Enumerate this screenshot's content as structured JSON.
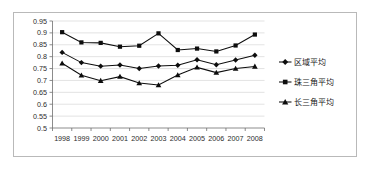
{
  "chart_data": {
    "type": "line",
    "title": "",
    "xlabel": "",
    "ylabel": "",
    "grid": true,
    "legend_position": "right",
    "ylim": [
      0.5,
      0.95
    ],
    "ytick_labels": [
      "0.95",
      "0.9",
      "0.85",
      "0.8",
      "0.75",
      "0.7",
      "0.65",
      "0.6",
      "0.55",
      "0.5"
    ],
    "ytick_values": [
      0.95,
      0.9,
      0.85,
      0.8,
      0.75,
      0.7,
      0.65,
      0.6,
      0.55,
      0.5
    ],
    "categories": [
      "1998",
      "1999",
      "2000",
      "2001",
      "2002",
      "2003",
      "2004",
      "2005",
      "2006",
      "2007",
      "2008"
    ],
    "series": [
      {
        "name": "区域平均",
        "marker": "diamond",
        "values": [
          0.818,
          0.775,
          0.76,
          0.765,
          0.75,
          0.761,
          0.764,
          0.787,
          0.766,
          0.786,
          0.806
        ]
      },
      {
        "name": "珠三角平均",
        "marker": "square",
        "values": [
          0.903,
          0.86,
          0.858,
          0.842,
          0.846,
          0.898,
          0.828,
          0.834,
          0.822,
          0.847,
          0.893
        ]
      },
      {
        "name": "长三角平均",
        "marker": "triangle",
        "values": [
          0.772,
          0.722,
          0.699,
          0.716,
          0.689,
          0.681,
          0.723,
          0.755,
          0.733,
          0.75,
          0.759
        ]
      }
    ]
  },
  "legend": {
    "items": [
      {
        "label": "区域平均",
        "marker": "diamond"
      },
      {
        "label": "珠三角平均",
        "marker": "square"
      },
      {
        "label": "长三角平均",
        "marker": "triangle"
      }
    ]
  }
}
